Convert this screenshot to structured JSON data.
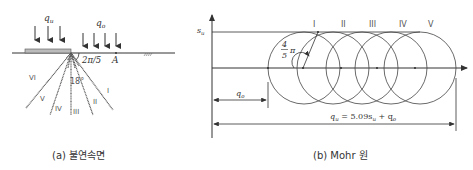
{
  "figure_a": {
    "caption": "(a) 불연속면",
    "load_left_label": "q",
    "load_left_sub": "u",
    "load_right_label": "q",
    "load_right_sub": "o",
    "angle_label": "2π/5",
    "point_label": "A",
    "fan_angle_label": "18°",
    "zone_labels": [
      "I",
      "II",
      "III",
      "IV",
      "V",
      "VI"
    ]
  },
  "figure_b": {
    "caption": "(b) Mohr 원",
    "y_axis_label": "s",
    "y_axis_sub": "u",
    "circle_labels": [
      "I",
      "II",
      "III",
      "IV",
      "V"
    ],
    "angle_num": "4",
    "angle_den": "5",
    "angle_pi": "π",
    "qo_dim_label": "q",
    "qo_dim_sub": "o",
    "total_dim_label": "q",
    "total_dim_sub": "u",
    "total_dim_expr": " = 5.09s",
    "total_dim_expr_sub": "u",
    "total_dim_tail": " + q",
    "total_dim_tail_sub": "o"
  },
  "colors": {
    "line": "#333333",
    "hatch": "#666666",
    "footing": "#bbbbbb"
  }
}
